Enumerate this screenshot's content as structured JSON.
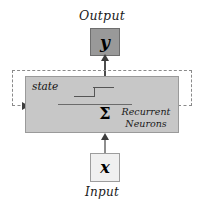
{
  "diagram": {
    "output": {
      "label": "Output",
      "node_symbol": "y"
    },
    "input": {
      "label": "Input",
      "node_symbol": "x"
    },
    "cell": {
      "state_label": "state",
      "summation_symbol": "Σ",
      "caption_line1": "Recurrent",
      "caption_line2": "Neurons",
      "activation": "step-function"
    },
    "colors": {
      "cell_fill": "#c7c7c7",
      "cell_border": "#9a9a9a",
      "output_fill": "#999999",
      "output_border": "#6e6e6e",
      "input_fill": "#f0f0f0",
      "input_border": "#9d9d9d",
      "loop_dash": "#8a8a8a",
      "arrow": "#3d3d3d",
      "background": "#ffffff",
      "text": "#111111"
    }
  }
}
